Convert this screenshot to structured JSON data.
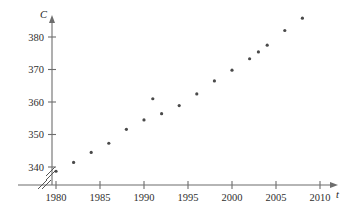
{
  "chart_data": {
    "type": "scatter",
    "title": "",
    "xlabel": "t",
    "ylabel": "C",
    "xlim": [
      1978.5,
      2011
    ],
    "ylim": [
      336,
      388
    ],
    "grid": false,
    "legend": null,
    "axis_break": {
      "x": true,
      "y": true,
      "symbol": "//"
    },
    "x_ticks": [
      1980,
      1985,
      1990,
      1995,
      2000,
      2005,
      2010
    ],
    "x_tick_labels": [
      "1980",
      "1985",
      "1990",
      "1995",
      "2000",
      "2005",
      "2010"
    ],
    "y_ticks": [
      340,
      350,
      360,
      370,
      380
    ],
    "y_tick_labels": [
      "340",
      "350",
      "360",
      "370",
      "380"
    ],
    "x": [
      1980,
      1982,
      1984,
      1986,
      1988,
      1990,
      1991,
      1992,
      1994,
      1996,
      1998,
      2000,
      2002,
      2003,
      2004,
      2006,
      2008
    ],
    "values": [
      338.7,
      341.4,
      344.5,
      347.3,
      351.6,
      354.5,
      361.0,
      356.4,
      358.9,
      362.5,
      366.5,
      369.8,
      373.3,
      375.4,
      377.5,
      382.0,
      385.8
    ],
    "points": [
      {
        "x": 1980,
        "y": 338.7
      },
      {
        "x": 1982,
        "y": 341.4
      },
      {
        "x": 1984,
        "y": 344.5
      },
      {
        "x": 1986,
        "y": 347.3
      },
      {
        "x": 1988,
        "y": 351.6
      },
      {
        "x": 1990,
        "y": 354.5
      },
      {
        "x": 1991,
        "y": 361.0
      },
      {
        "x": 1992,
        "y": 356.4
      },
      {
        "x": 1994,
        "y": 358.9
      },
      {
        "x": 1996,
        "y": 362.5
      },
      {
        "x": 1998,
        "y": 366.5
      },
      {
        "x": 2000,
        "y": 369.8
      },
      {
        "x": 2002,
        "y": 373.3
      },
      {
        "x": 2003,
        "y": 375.4
      },
      {
        "x": 2004,
        "y": 377.5
      },
      {
        "x": 2006,
        "y": 382.0
      },
      {
        "x": 2008,
        "y": 385.8
      }
    ],
    "marker": {
      "shape": "dot",
      "size": 1.6,
      "color": "#4a4a4a"
    }
  },
  "colors": {
    "axis": "#6d6d6d",
    "text": "#2f2f2f",
    "marker": "#4a4a4a",
    "background": "#ffffff"
  }
}
